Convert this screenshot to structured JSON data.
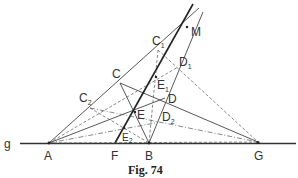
{
  "figure": {
    "caption": "Fig. 74",
    "line_label": "g"
  },
  "points": {
    "A": {
      "label": "A",
      "sub": "",
      "x": 49,
      "y": 143
    },
    "F": {
      "label": "F",
      "sub": "",
      "x": 115,
      "y": 143
    },
    "B": {
      "label": "B",
      "sub": "",
      "x": 149,
      "y": 143
    },
    "G": {
      "label": "G",
      "sub": "",
      "x": 258,
      "y": 142
    },
    "M": {
      "label": "M",
      "sub": "",
      "x": 187,
      "y": 27
    },
    "C": {
      "label": "C",
      "sub": "",
      "x": 120,
      "y": 83
    },
    "C1": {
      "label": "C",
      "sub": "1",
      "x": 158,
      "y": 50
    },
    "C2": {
      "label": "C",
      "sub": "2",
      "x": 90,
      "y": 108
    },
    "D": {
      "label": "D",
      "sub": "",
      "x": 165,
      "y": 98
    },
    "D1": {
      "label": "D",
      "sub": "1",
      "x": 178,
      "y": 67
    },
    "D2": {
      "label": "D",
      "sub": "2",
      "x": 155,
      "y": 123
    },
    "E": {
      "label": "E",
      "sub": "",
      "x": 135,
      "y": 112
    },
    "E1": {
      "label": "E",
      "sub": "1",
      "x": 156,
      "y": 77
    },
    "E2": {
      "label": "E",
      "sub": "2",
      "x": 124,
      "y": 128
    }
  }
}
